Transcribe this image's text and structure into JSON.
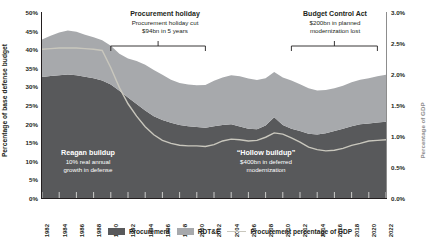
{
  "chart_data": {
    "type": "area",
    "title": "",
    "ylabel_left": "Percentage of base defense budget",
    "ylabel_right": "Percentage of GDP",
    "xlabel": "",
    "grid": false,
    "legend_position": "bottom",
    "ylim_left": [
      0,
      50
    ],
    "ylim_right": [
      0.0,
      3.0
    ],
    "y_ticks_left": [
      "0%",
      "5%",
      "10%",
      "15%",
      "20%",
      "25%",
      "30%",
      "35%",
      "40%",
      "45%",
      "50%"
    ],
    "y_ticks_left_values": [
      0,
      5,
      10,
      15,
      20,
      25,
      30,
      35,
      40,
      45,
      50
    ],
    "y_ticks_right": [
      "0.0%",
      "0.5%",
      "1.0%",
      "1.5%",
      "2.0%",
      "2.5%",
      "3.0%"
    ],
    "y_ticks_right_values": [
      0.0,
      0.5,
      1.0,
      1.5,
      2.0,
      2.5,
      3.0
    ],
    "x_tick_labels": [
      "1982",
      "1984",
      "1986",
      "1988",
      "1990",
      "1992",
      "1994",
      "1996",
      "1998",
      "2000",
      "2002",
      "2004",
      "2006",
      "2008",
      "2010",
      "2012",
      "2014",
      "2016",
      "2018",
      "2020",
      "2022"
    ],
    "x": [
      1982,
      1983,
      1984,
      1985,
      1986,
      1987,
      1988,
      1989,
      1990,
      1991,
      1992,
      1993,
      1994,
      1995,
      1996,
      1997,
      1998,
      1999,
      2000,
      2001,
      2002,
      2003,
      2004,
      2005,
      2006,
      2007,
      2008,
      2009,
      2010,
      2011,
      2012,
      2013,
      2014,
      2015,
      2016,
      2017,
      2018,
      2019,
      2020,
      2021,
      2022
    ],
    "xlim": [
      1982,
      2022
    ],
    "series": [
      {
        "name": "Procurement",
        "color": "#58595b",
        "stack": 1,
        "values": [
          32.5,
          32.8,
          33.0,
          33.2,
          33.0,
          32.6,
          32.2,
          31.6,
          30.5,
          28.8,
          27.0,
          25.3,
          23.5,
          22.0,
          21.0,
          20.2,
          19.6,
          19.3,
          19.1,
          18.9,
          19.3,
          19.6,
          19.8,
          19.2,
          18.6,
          18.5,
          19.5,
          21.7,
          19.6,
          18.6,
          18.0,
          17.3,
          17.1,
          17.4,
          18.0,
          18.6,
          19.3,
          19.8,
          20.0,
          20.3,
          20.5
        ]
      },
      {
        "name": "RDT&E",
        "color": "#a7a9ac",
        "stack": 2,
        "values": [
          10.1,
          10.8,
          11.5,
          11.8,
          11.7,
          11.3,
          11.0,
          10.8,
          10.4,
          10.0,
          10.5,
          11.5,
          12.3,
          12.4,
          12.1,
          11.6,
          11.3,
          11.2,
          11.2,
          11.5,
          12.2,
          12.8,
          13.2,
          13.5,
          13.5,
          13.2,
          12.7,
          12.2,
          12.8,
          13.0,
          12.6,
          12.2,
          11.8,
          11.6,
          11.5,
          11.6,
          11.8,
          12.0,
          12.2,
          12.4,
          12.6
        ]
      }
    ],
    "line_series": {
      "name": "Procurement percentage of GDP",
      "color": "#c9c7bd",
      "axis": "right",
      "values": [
        2.4,
        2.41,
        2.42,
        2.42,
        2.42,
        2.41,
        2.4,
        2.38,
        2.1,
        1.78,
        1.52,
        1.32,
        1.15,
        1.02,
        0.93,
        0.88,
        0.85,
        0.84,
        0.84,
        0.83,
        0.86,
        0.92,
        0.95,
        0.94,
        0.92,
        0.93,
        0.98,
        1.05,
        1.03,
        0.97,
        0.9,
        0.82,
        0.78,
        0.76,
        0.77,
        0.8,
        0.85,
        0.88,
        0.92,
        0.93,
        0.94
      ]
    },
    "annotations": [
      {
        "id": "procurement-holiday",
        "headline": "Procurement holiday",
        "lines": [
          "Procurement holiday cut",
          "$94bn in 5 years"
        ],
        "bracket_start_year": 1990,
        "bracket_end_year": 2001
      },
      {
        "id": "budget-control-act",
        "headline": "Budget Control Act",
        "lines": [
          "$200bn in planned",
          "modernization lost"
        ],
        "bracket_start_year": 2011,
        "bracket_end_year": 2021
      }
    ],
    "callouts": [
      {
        "id": "reagan-buildup",
        "headline": "Reagan buildup",
        "lines": [
          "10% real annual",
          "growth in defense"
        ]
      },
      {
        "id": "hollow-buildup",
        "headline": "“Hollow buildup”",
        "lines": [
          "$400bn in deferred",
          "modernization"
        ]
      }
    ],
    "legend": [
      {
        "label": "Procurement",
        "swatch": "#58595b",
        "kind": "box"
      },
      {
        "label": "RDT&E",
        "swatch": "#a7a9ac",
        "kind": "box"
      },
      {
        "label": "Procurement percentage of GDP",
        "swatch": "#c9c7bd",
        "kind": "line"
      }
    ]
  }
}
